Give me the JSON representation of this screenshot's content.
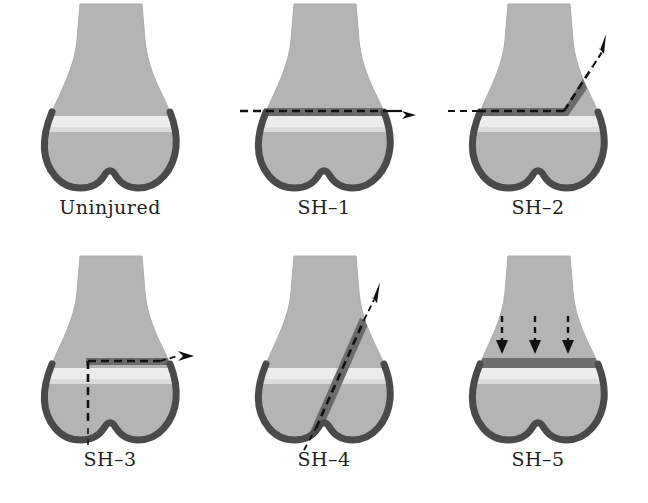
{
  "figure": {
    "background_color": "#ffffff",
    "rows": 2,
    "columns": 3
  },
  "colors": {
    "bone": "#b4b4b4",
    "bone_edge": "#a8a8a8",
    "growth_plate": "#ececec",
    "growth_plate_crushed": "#6e6e6e",
    "cortex": "#4a4a4a",
    "fracture_band": "#6b6b6b",
    "fracture_dash": "#111111",
    "arrow": "#111111",
    "label_text": "#231f20"
  },
  "panels": [
    {
      "id": "uninjured",
      "label": "Uninjured",
      "description": "Normal distal femur with intact physis",
      "fracture": "none",
      "arrows": 0
    },
    {
      "id": "sh-1",
      "label": "SH–1",
      "description": "Fracture through the growth plate only, transverse",
      "fracture": "horizontal-physis",
      "arrows": 1
    },
    {
      "id": "sh-2",
      "label": "SH–2",
      "description": "Fracture through growth plate exiting into metaphysis",
      "fracture": "physis-plus-metaphysis",
      "arrows": 1
    },
    {
      "id": "sh-3",
      "label": "SH–3",
      "description": "Fracture through growth plate exiting into epiphysis",
      "fracture": "physis-plus-epiphysis",
      "arrows": 1
    },
    {
      "id": "sh-4",
      "label": "SH–4",
      "description": "Oblique fracture crossing metaphysis, physis and epiphysis",
      "fracture": "oblique-through-all",
      "arrows": 1
    },
    {
      "id": "sh-5",
      "label": "SH–5",
      "description": "Crush injury compressing the growth plate",
      "fracture": "compression",
      "arrows": 3
    }
  ]
}
